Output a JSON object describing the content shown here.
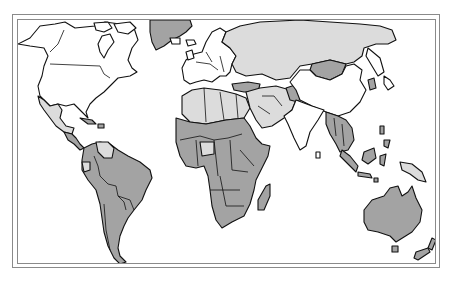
{
  "map": {
    "type": "world-choropleth",
    "colors": {
      "background": "#ffffff",
      "frame": "#8a8a8a",
      "outline": "#111111",
      "category_none": "#ffffff",
      "category_light": "#dcdcdc",
      "category_dark": "#a3a3a3"
    },
    "regions": [
      {
        "name": "North America (Canada, USA)",
        "category": "none"
      },
      {
        "name": "Greenland",
        "category": "dark"
      },
      {
        "name": "Mexico",
        "category": "light"
      },
      {
        "name": "Central America",
        "category": "dark"
      },
      {
        "name": "Venezuela",
        "category": "light"
      },
      {
        "name": "South America",
        "category": "dark"
      },
      {
        "name": "Western Europe",
        "category": "none"
      },
      {
        "name": "Russia / Eastern Europe",
        "category": "light"
      },
      {
        "name": "North Africa",
        "category": "light"
      },
      {
        "name": "Sub-Saharan Africa",
        "category": "dark"
      },
      {
        "name": "Madagascar",
        "category": "dark"
      },
      {
        "name": "Middle East / Arabian Peninsula",
        "category": "light"
      },
      {
        "name": "Turkey",
        "category": "dark"
      },
      {
        "name": "Afghanistan",
        "category": "dark"
      },
      {
        "name": "Mongolia",
        "category": "dark"
      },
      {
        "name": "China",
        "category": "none"
      },
      {
        "name": "India",
        "category": "none"
      },
      {
        "name": "Southeast Asia",
        "category": "dark"
      },
      {
        "name": "Indonesia / Borneo",
        "category": "dark"
      },
      {
        "name": "Papua New Guinea",
        "category": "light"
      },
      {
        "name": "Japan",
        "category": "none"
      },
      {
        "name": "Australia",
        "category": "dark"
      },
      {
        "name": "New Zealand",
        "category": "dark"
      }
    ]
  }
}
